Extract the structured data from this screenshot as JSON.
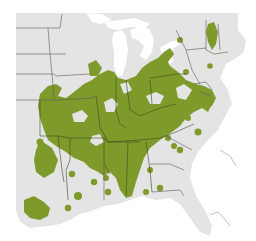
{
  "map": {
    "title": "",
    "region": "Eastern United States",
    "colors": {
      "land": "#e4e4e4",
      "water": "#ffffff",
      "range": "#7d9a2a",
      "state_border": "#5a5a5a"
    },
    "legend": []
  }
}
